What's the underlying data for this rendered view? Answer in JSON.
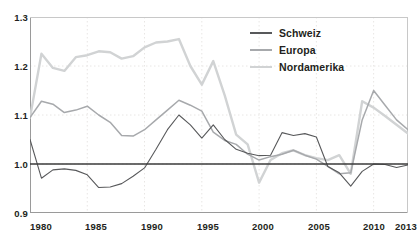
{
  "chart_data": {
    "type": "line",
    "title": "",
    "subtitle": "",
    "xlabel": "",
    "ylabel": "",
    "xlim": [
      1980,
      2013
    ],
    "ylim": [
      0.9,
      1.3
    ],
    "grid": true,
    "legend_position": "top-right",
    "reference_line": 1.0,
    "y_ticks": [
      "0.9",
      "1.0",
      "1.1",
      "1.2",
      "1.3"
    ],
    "y_tick_values": [
      0.9,
      1.0,
      1.1,
      1.2,
      1.3
    ],
    "x_ticks": [
      "1980",
      "1985",
      "1990",
      "1995",
      "2000",
      "2005",
      "2010",
      "2013"
    ],
    "x_tick_values": [
      1980,
      1985,
      1990,
      1995,
      2000,
      2005,
      2010,
      2013
    ],
    "x": [
      1980,
      1981,
      1982,
      1983,
      1984,
      1985,
      1986,
      1987,
      1988,
      1989,
      1990,
      1991,
      1992,
      1993,
      1994,
      1995,
      1996,
      1997,
      1998,
      1999,
      2000,
      2001,
      2002,
      2003,
      2004,
      2005,
      2006,
      2007,
      2008,
      2009,
      2010,
      2011,
      2012,
      2013
    ],
    "series": [
      {
        "name": "Schweiz",
        "color": "#58595b",
        "values": [
          1.05,
          0.971,
          0.988,
          0.99,
          0.987,
          0.978,
          0.952,
          0.953,
          0.96,
          0.975,
          0.992,
          1.03,
          1.07,
          1.1,
          1.08,
          1.053,
          1.08,
          1.05,
          1.03,
          1.022,
          1.017,
          1.018,
          1.064,
          1.058,
          1.062,
          1.055,
          0.995,
          0.982,
          0.955,
          0.985,
          1.0,
          0.999,
          0.993,
          0.998
        ]
      },
      {
        "name": "Europa",
        "color": "#a7a9ac",
        "values": [
          1.095,
          1.128,
          1.122,
          1.105,
          1.11,
          1.118,
          1.1,
          1.085,
          1.058,
          1.057,
          1.07,
          1.09,
          1.11,
          1.13,
          1.12,
          1.108,
          1.065,
          1.048,
          1.04,
          1.02,
          1.008,
          1.015,
          1.02,
          1.028,
          1.018,
          1.01,
          0.995,
          0.98,
          0.982,
          1.09,
          1.15,
          1.12,
          1.09,
          1.07
        ]
      },
      {
        "name": "Nordamerika",
        "color": "#d1d3d4",
        "values": [
          1.095,
          1.225,
          1.196,
          1.19,
          1.218,
          1.222,
          1.23,
          1.228,
          1.215,
          1.22,
          1.238,
          1.248,
          1.25,
          1.255,
          1.2,
          1.162,
          1.21,
          1.14,
          1.06,
          1.04,
          0.962,
          1.008,
          1.022,
          1.028,
          1.018,
          1.012,
          1.008,
          1.018,
          0.98,
          1.128,
          1.115,
          1.098,
          1.08,
          1.062
        ]
      }
    ]
  },
  "legend": {
    "items": [
      {
        "label": "Schweiz"
      },
      {
        "label": "Europa"
      },
      {
        "label": "Nordamerika"
      }
    ]
  },
  "axes": {
    "y_labels": [
      "1.3",
      "1.2",
      "1.1",
      "1.0",
      "0.9"
    ],
    "x_labels": [
      "1980",
      "1985",
      "1990",
      "1995",
      "2000",
      "2005",
      "2010",
      "2013"
    ]
  },
  "colors": {
    "schweiz": "#58595b",
    "europa": "#a7a9ac",
    "nordamerika": "#d1d3d4",
    "axis": "#808080",
    "grid": "#e8e6e4",
    "reference": "#3b3b3b",
    "text": "#231f20"
  }
}
